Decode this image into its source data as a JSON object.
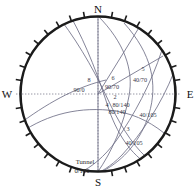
{
  "diagram": {
    "type": "stereonet",
    "projection": "equal-angle lower hemisphere",
    "title": "",
    "center": {
      "x": 98,
      "y": 94
    },
    "radius": 78,
    "tick_count": 36,
    "grid": "dotted-crosshair"
  },
  "cardinals": {
    "north": "N",
    "south": "S",
    "east": "E",
    "west": "W"
  },
  "colors": {
    "circle": "#1b1b1b",
    "arc": "#6f6f86",
    "grid": "#8a8a9a",
    "text": "#2a2a3a",
    "background": "#ffffff"
  },
  "planes": [
    {
      "id": "8",
      "label": "8",
      "value": "90/0",
      "label_x": 89,
      "label_y": 82,
      "value_x": 78,
      "value_y": 92
    },
    {
      "id": "6",
      "label": "6",
      "value": "90/70",
      "label_x": 113,
      "label_y": 80,
      "value_x": 106,
      "value_y": 89
    },
    {
      "id": "5",
      "label": "5",
      "value": "40/70",
      "label_x": 143,
      "label_y": 71,
      "value_x": 133,
      "value_y": 82
    },
    {
      "id": "2",
      "label": "2",
      "value": "80/140",
      "label_x": 114,
      "label_y": 98,
      "value_x": 110,
      "value_y": 107
    },
    {
      "id": "4",
      "label": "4",
      "value": "80/140",
      "label_x": 104,
      "label_y": 106,
      "value_x": 103,
      "value_y": 115
    },
    {
      "id": "1",
      "label": "",
      "value": "40/105",
      "label_x": 0,
      "label_y": 0,
      "value_x": 138,
      "value_y": 116
    },
    {
      "id": "3",
      "label": "3",
      "value": "40/105",
      "label_x": 128,
      "label_y": 131,
      "value_x": 124,
      "value_y": 144
    }
  ],
  "tunnel": {
    "name": "Tunnel",
    "value": "0/180",
    "name_x": 72,
    "name_y": 163,
    "value_x": 70,
    "value_y": 172
  },
  "arcs": [
    {
      "name": "arc-90-0",
      "d": "M 98,16 L 98,172"
    },
    {
      "name": "arc-90-70",
      "d": "M 98,16 C 122,40 132,70 128,94 C 124,122 112,150 98,172"
    },
    {
      "name": "arc-40-70",
      "d": "M 125,24 C 150,52 156,82 148,112 C 141,138 124,158 104,170"
    },
    {
      "name": "arc-80-140",
      "d": "M 62,21 C 82,46 96,74 110,104 C 122,128 134,148 148,160"
    },
    {
      "name": "arc-80-140b",
      "d": "M 70,18 C 86,44 98,76 108,108 C 118,136 132,156 150,166"
    },
    {
      "name": "arc-40-105",
      "d": "M 160,52 C 150,84 134,114 116,140 C 104,156 92,166 80,172"
    },
    {
      "name": "arc-40-105b",
      "d": "M 172,74 C 160,104 142,132 122,154 C 110,166 100,172 92,174"
    },
    {
      "name": "arc-tunnel",
      "d": "M 22,132 C 48,116 78,108 114,112 C 136,116 152,124 166,136"
    },
    {
      "name": "arc-lower",
      "d": "M 24,120 C 52,100 80,86 104,80"
    }
  ]
}
